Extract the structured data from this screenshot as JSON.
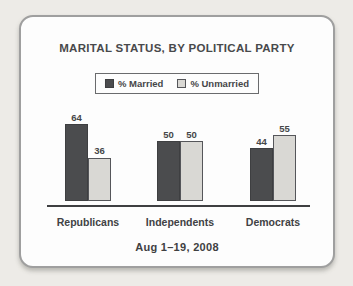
{
  "card": {
    "title": "MARITAL STATUS, BY POLITICAL PARTY",
    "footer": "Aug 1–19, 2008"
  },
  "legend": {
    "items": [
      {
        "label": "% Married",
        "swatch_color": "#4b4c4e",
        "swatch_border": "#3e3f41"
      },
      {
        "label": "% Unmarried",
        "swatch_color": "#d9d8d4",
        "swatch_border": "#55565a"
      }
    ]
  },
  "chart_data": {
    "type": "bar",
    "title": "MARITAL STATUS, BY POLITICAL PARTY",
    "subtitle": "Aug 1–19, 2008",
    "categories": [
      "Republicans",
      "Independents",
      "Democrats"
    ],
    "series": [
      {
        "name": "% Married",
        "values": [
          64,
          50,
          44
        ],
        "color": "#4b4c4e",
        "border": "#3e3f41"
      },
      {
        "name": "% Unmarried",
        "values": [
          36,
          50,
          55
        ],
        "color": "#d9d8d4",
        "border": "#55565a"
      }
    ],
    "ylim": [
      0,
      70
    ],
    "value_labels": true,
    "legend_position": "top",
    "grid": false,
    "xlabel": "",
    "ylabel": ""
  }
}
